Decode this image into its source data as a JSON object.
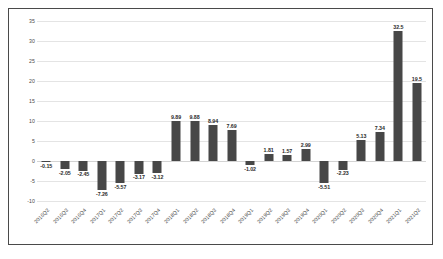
{
  "chart_data": {
    "type": "bar",
    "title": "",
    "subtitle": "",
    "xlabel": "",
    "ylabel": "",
    "ylim": [
      -10,
      35
    ],
    "y_ticks": [
      35,
      30,
      25,
      20,
      15,
      10,
      5,
      0,
      -5,
      -10
    ],
    "grid": true,
    "legend": "none",
    "bar_color": "#474747",
    "gridline_color": "#e4e4e4",
    "categories": [
      "2016Q2",
      "2016Q3",
      "2016Q4",
      "2017Q1",
      "2017Q2",
      "2017Q3",
      "2017Q4",
      "2018Q1",
      "2018Q2",
      "2018Q3",
      "2018Q4",
      "2019Q1",
      "2019Q2",
      "2019Q3",
      "2019Q4",
      "2020Q1",
      "2020Q2",
      "2020Q3",
      "2020Q4",
      "2021Q1",
      "2021Q2"
    ],
    "values": [
      -0.15,
      -2.05,
      -2.45,
      -7.26,
      -5.57,
      -3.17,
      -3.12,
      9.89,
      9.88,
      8.94,
      7.69,
      -1.02,
      1.81,
      1.57,
      2.99,
      -5.51,
      -2.23,
      5.13,
      7.34,
      32.5,
      19.5
    ],
    "data_labels": [
      "-0.15",
      "-2.05",
      "-2.45",
      "-7.26",
      "-5.57",
      "-3.17",
      "-3.12",
      "9.89",
      "9.88",
      "8.94",
      "7.69",
      "-1.02",
      "1.81",
      "1.57",
      "2.99",
      "-5.51",
      "-2.23",
      "5.13",
      "7.34",
      "32.5",
      "19.5"
    ]
  }
}
